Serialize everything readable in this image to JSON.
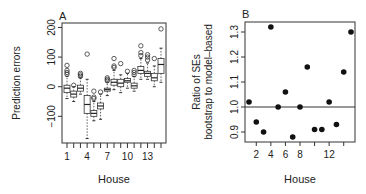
{
  "chart_data": [
    {
      "panel": "A",
      "type": "box",
      "title": "A",
      "xlabel": "House",
      "ylabel": "Prediction errors",
      "ylim": [
        -190,
        215
      ],
      "yticks": [
        -100,
        0,
        100,
        200
      ],
      "ytick_labels": [
        "−100",
        "0",
        "100",
        "200"
      ],
      "xticks": [
        1,
        4,
        7,
        10,
        13
      ],
      "xtick_labels": [
        "1",
        "4",
        "7",
        "10",
        "13"
      ],
      "categories": [
        1,
        2,
        3,
        4,
        5,
        6,
        7,
        8,
        9,
        10,
        11,
        12,
        13,
        14,
        15
      ],
      "boxes": [
        {
          "house": 1,
          "q1": -20,
          "median": -5,
          "q3": 5,
          "wlo": -40,
          "whi": 35,
          "outliers": [
            42,
            48,
            55,
            72
          ]
        },
        {
          "house": 2,
          "q1": -35,
          "median": -25,
          "q3": -15,
          "wlo": -50,
          "whi": 0,
          "outliers": [
            5
          ]
        },
        {
          "house": 3,
          "q1": -15,
          "median": -5,
          "q3": 5,
          "wlo": -25,
          "whi": 30,
          "outliers": [
            35,
            40,
            45
          ]
        },
        {
          "house": 4,
          "q1": -90,
          "median": -60,
          "q3": -30,
          "wlo": -175,
          "whi": 25,
          "outliers": [
            110
          ]
        },
        {
          "house": 5,
          "q1": -100,
          "median": -90,
          "q3": -80,
          "wlo": -115,
          "whi": -50,
          "outliers": [
            -40,
            -35,
            -15
          ]
        },
        {
          "house": 6,
          "q1": -75,
          "median": -65,
          "q3": -55,
          "wlo": -110,
          "whi": -25,
          "outliers": [
            -18
          ]
        },
        {
          "house": 7,
          "q1": -15,
          "median": -10,
          "q3": -5,
          "wlo": -30,
          "whi": 15,
          "outliers": [
            20,
            25,
            30
          ]
        },
        {
          "house": 8,
          "q1": 5,
          "median": 15,
          "q3": 25,
          "wlo": -10,
          "whi": 55,
          "outliers": [
            65,
            70,
            95
          ]
        },
        {
          "house": 9,
          "q1": 0,
          "median": 12,
          "q3": 25,
          "wlo": -20,
          "whi": 40,
          "outliers": [
            78
          ]
        },
        {
          "house": 10,
          "q1": 15,
          "median": 20,
          "q3": 28,
          "wlo": -5,
          "whi": 45,
          "outliers": [
            52
          ]
        },
        {
          "house": 11,
          "q1": -5,
          "median": 3,
          "q3": 12,
          "wlo": -15,
          "whi": 35,
          "outliers": [
            40,
            48,
            55
          ]
        },
        {
          "house": 12,
          "q1": 45,
          "median": 55,
          "q3": 68,
          "wlo": 25,
          "whi": 95,
          "outliers": [
            105,
            115,
            138
          ]
        },
        {
          "house": 13,
          "q1": 35,
          "median": 45,
          "q3": 52,
          "wlo": 25,
          "whi": 80,
          "outliers": [
            90,
            100,
            108
          ]
        },
        {
          "house": 14,
          "q1": 20,
          "median": 30,
          "q3": 45,
          "wlo": 0,
          "whi": 70,
          "outliers": [
            95
          ]
        },
        {
          "house": 15,
          "q1": 45,
          "median": 75,
          "q3": 95,
          "wlo": 15,
          "whi": 130,
          "outliers": [
            195
          ]
        }
      ]
    },
    {
      "panel": "B",
      "type": "scatter",
      "title": "B",
      "xlabel": "House",
      "ylabel": "Ratio of SEs\nbootstrap to model–based",
      "ylabel_lines": [
        "Ratio of SEs",
        "bootstrap to model–based"
      ],
      "ylim": [
        0.86,
        1.34
      ],
      "yticks": [
        0.9,
        1.0,
        1.1,
        1.2,
        1.3
      ],
      "ytick_labels": [
        "0.9",
        "1.0",
        "1.1",
        "1.2",
        "1.3"
      ],
      "xticks": [
        2,
        4,
        6,
        8,
        12
      ],
      "xtick_labels": [
        "2",
        "4",
        "6",
        "8",
        "12"
      ],
      "reference_line": 1.0,
      "x": [
        1,
        2,
        3,
        4,
        5,
        6,
        7,
        8,
        9,
        10,
        11,
        12,
        13,
        14,
        15
      ],
      "y": [
        1.02,
        0.94,
        0.9,
        1.32,
        1.0,
        1.06,
        0.88,
        1.0,
        1.16,
        0.91,
        0.91,
        1.02,
        0.93,
        1.14,
        1.3
      ]
    }
  ]
}
